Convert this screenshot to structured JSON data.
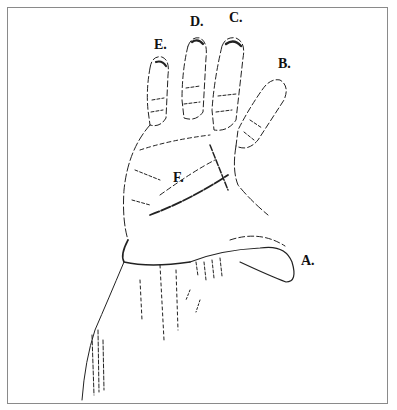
{
  "figure": {
    "labels": [
      {
        "id": "A",
        "text": "A.",
        "x": 301,
        "y": 253
      },
      {
        "id": "B",
        "text": "B.",
        "x": 278,
        "y": 56
      },
      {
        "id": "C",
        "text": "C.",
        "x": 229,
        "y": 10
      },
      {
        "id": "D",
        "text": "D.",
        "x": 190,
        "y": 14
      },
      {
        "id": "E",
        "text": "E.",
        "x": 154,
        "y": 37
      },
      {
        "id": "F",
        "text": "F.",
        "x": 173,
        "y": 170
      }
    ]
  }
}
